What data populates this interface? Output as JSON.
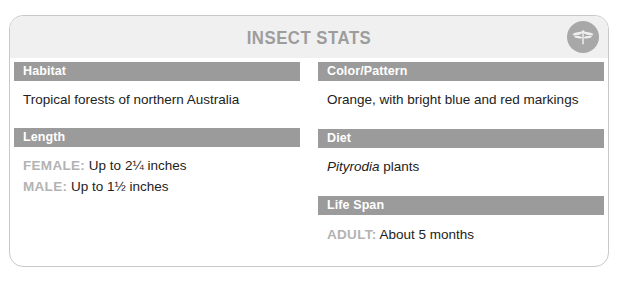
{
  "header": {
    "title": "INSECT STATS",
    "badge_icon": "dragonfly-icon"
  },
  "colors": {
    "section_header_bg": "#9b9b9b",
    "header_bg": "#f0f0f0",
    "title_text": "#9d9d9d",
    "badge_bg": "#a8a8a8",
    "label_text": "#b3b3b3",
    "body_text": "#222222",
    "card_border": "#c9c9c9"
  },
  "left_column": {
    "habitat": {
      "header": "Habitat",
      "value": "Tropical forests of northern Australia"
    },
    "length": {
      "header": "Length",
      "female_label": "FEMALE:",
      "female_value": "Up to 2¼ inches",
      "male_label": "MALE:",
      "male_value": "Up to 1½ inches"
    }
  },
  "right_column": {
    "color_pattern": {
      "header": "Color/Pattern",
      "value": "Orange, with bright blue and red markings"
    },
    "diet": {
      "header": "Diet",
      "genus": "Pityrodia",
      "value_suffix": " plants"
    },
    "life_span": {
      "header": "Life Span",
      "adult_label": "ADULT:",
      "adult_value": "About 5 months"
    }
  }
}
